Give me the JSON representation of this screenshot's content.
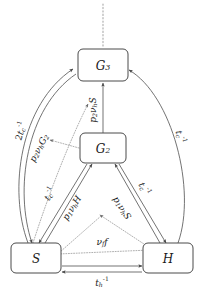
{
  "figure": {
    "type": "compartment-flow-diagram",
    "background_color": "#ffffff",
    "line_color": "#5a5a5a",
    "dotted_color": "#9a9a9a",
    "text_color": "#1a1a1a"
  },
  "nodes": [
    {
      "id": "G3",
      "label_main": "G",
      "label_sub": "3",
      "x": 103,
      "y": 65,
      "w": 50,
      "h": 32
    },
    {
      "id": "G2",
      "label_main": "G",
      "label_sub": "2",
      "x": 103,
      "y": 148,
      "w": 46,
      "h": 30
    },
    {
      "id": "S",
      "label_main": "S",
      "label_sub": "",
      "x": 36,
      "y": 258,
      "w": 50,
      "h": 30
    },
    {
      "id": "H",
      "label_main": "H",
      "label_sub": "",
      "x": 168,
      "y": 258,
      "w": 50,
      "h": 30
    }
  ],
  "edge_labels": [
    {
      "id": "two-tc-inv",
      "text_parts": [
        {
          "t": "2",
          "style": "up"
        },
        {
          "t": "t",
          "style": "it"
        },
        {
          "t": "c",
          "style": "sub"
        },
        {
          "t": "-1",
          "style": "sup"
        }
      ],
      "plain": "2tc-1",
      "x": 21,
      "y": 131,
      "rotate": -72
    },
    {
      "id": "p2vhG2",
      "text_parts": [
        {
          "t": "p",
          "style": "it"
        },
        {
          "t": "2",
          "style": "sub"
        },
        {
          "t": "ν",
          "style": "it"
        },
        {
          "t": "h",
          "style": "sub"
        },
        {
          "t": "G",
          "style": "it"
        },
        {
          "t": "2",
          "style": "sub"
        }
      ],
      "plain": "p2vhG2",
      "x": 39,
      "y": 148,
      "rotate": -62
    },
    {
      "id": "tc-inv-left",
      "text_parts": [
        {
          "t": "t",
          "style": "it"
        },
        {
          "t": "c",
          "style": "sub"
        },
        {
          "t": "-1",
          "style": "sup"
        }
      ],
      "plain": "tc-1",
      "x": 50,
      "y": 194,
      "rotate": -58
    },
    {
      "id": "p1vhH",
      "text_parts": [
        {
          "t": "p",
          "style": "it"
        },
        {
          "t": "1",
          "style": "sub"
        },
        {
          "t": "ν",
          "style": "it"
        },
        {
          "t": "h",
          "style": "sub"
        },
        {
          "t": "H",
          "style": "it"
        }
      ],
      "plain": "p1vhH",
      "x": 72,
      "y": 208,
      "rotate": -58
    },
    {
      "id": "p2vhS",
      "text_parts": [
        {
          "t": "p",
          "style": "it"
        },
        {
          "t": "2",
          "style": "sub"
        },
        {
          "t": "ν",
          "style": "it"
        },
        {
          "t": "h",
          "style": "sub"
        },
        {
          "t": "S",
          "style": "it"
        }
      ],
      "plain": "p2vhS",
      "x": 93,
      "y": 110,
      "rotate": -90
    },
    {
      "id": "p1vhS",
      "text_parts": [
        {
          "t": "p",
          "style": "it"
        },
        {
          "t": "1",
          "style": "sub"
        },
        {
          "t": "ν",
          "style": "it"
        },
        {
          "t": "h",
          "style": "sub"
        },
        {
          "t": "S",
          "style": "it"
        }
      ],
      "plain": "p1vhS",
      "x": 122,
      "y": 208,
      "rotate": 58
    },
    {
      "id": "tc-inv-mid",
      "text_parts": [
        {
          "t": "t",
          "style": "it"
        },
        {
          "t": "c",
          "style": "sub"
        },
        {
          "t": "-1",
          "style": "sup"
        }
      ],
      "plain": "tc-1",
      "x": 144,
      "y": 189,
      "rotate": 62
    },
    {
      "id": "tc-inv-right",
      "text_parts": [
        {
          "t": "t",
          "style": "it"
        },
        {
          "t": "c",
          "style": "sub"
        },
        {
          "t": "-1",
          "style": "sup"
        }
      ],
      "plain": "tc-1",
      "x": 180,
      "y": 137,
      "rotate": 75
    },
    {
      "id": "vff",
      "text_parts": [
        {
          "t": "ν",
          "style": "it"
        },
        {
          "t": "f",
          "style": "sub"
        },
        {
          "t": "f",
          "style": "it"
        }
      ],
      "plain": "vf f",
      "x": 102,
      "y": 242,
      "rotate": 0
    },
    {
      "id": "th-inv",
      "text_parts": [
        {
          "t": "t",
          "style": "it"
        },
        {
          "t": "h",
          "style": "sub"
        },
        {
          "t": "-1",
          "style": "sup"
        }
      ],
      "plain": "th-1",
      "x": 102,
      "y": 283,
      "rotate": 0
    }
  ],
  "legend": {
    "solid_meaning": "transition flow",
    "dotted_meaning": "rate dependency"
  }
}
